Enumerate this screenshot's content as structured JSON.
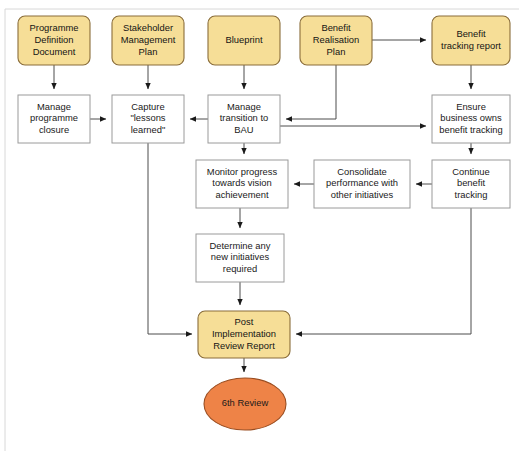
{
  "diagram": {
    "canvas": {
      "width": 520,
      "height": 451,
      "background": "#ffffff"
    },
    "colors": {
      "document_fill": "#f6de97",
      "document_stroke": "#8a6d3b",
      "process_fill": "#ffffff",
      "process_stroke": "#9a9a9a",
      "terminator_fill": "#ee8347",
      "terminator_stroke": "#9a4d20",
      "edge": "#4d4d4d",
      "text": "#1a1a1a",
      "frame": "#d8d8d8"
    },
    "nodes": [
      {
        "id": "programme-definition-document",
        "type": "document",
        "lines": [
          "Programme",
          "Definition",
          "Document"
        ],
        "x": 18,
        "y": 16,
        "w": 72,
        "h": 49,
        "rx": 7
      },
      {
        "id": "stakeholder-management-plan",
        "type": "document",
        "lines": [
          "Stakeholder",
          "Management",
          "Plan"
        ],
        "x": 112,
        "y": 16,
        "w": 72,
        "h": 49,
        "rx": 7
      },
      {
        "id": "blueprint",
        "type": "document",
        "lines": [
          "Blueprint"
        ],
        "x": 208,
        "y": 16,
        "w": 72,
        "h": 49,
        "rx": 7
      },
      {
        "id": "benefit-realisation-plan",
        "type": "document",
        "lines": [
          "Benefit",
          "Realisation",
          "Plan"
        ],
        "x": 300,
        "y": 16,
        "w": 72,
        "h": 49,
        "rx": 7
      },
      {
        "id": "benefit-tracking-report",
        "type": "document",
        "lines": [
          "Benefit",
          "tracking report"
        ],
        "x": 432,
        "y": 16,
        "w": 78,
        "h": 49,
        "rx": 7
      },
      {
        "id": "manage-programme-closure",
        "type": "process",
        "lines": [
          "Manage",
          "programme",
          "closure"
        ],
        "x": 18,
        "y": 95,
        "w": 72,
        "h": 48,
        "rx": 0
      },
      {
        "id": "capture-lessons-learned",
        "type": "process",
        "lines": [
          "Capture",
          "\"lessons",
          "learned\""
        ],
        "x": 112,
        "y": 95,
        "w": 72,
        "h": 48,
        "rx": 0
      },
      {
        "id": "manage-transition-to-bau",
        "type": "process",
        "lines": [
          "Manage",
          "transition to",
          "BAU"
        ],
        "x": 208,
        "y": 95,
        "w": 72,
        "h": 48,
        "rx": 0
      },
      {
        "id": "ensure-business-owns-benefit-tracking",
        "type": "process",
        "lines": [
          "Ensure",
          "business owns",
          "benefit tracking"
        ],
        "x": 432,
        "y": 95,
        "w": 78,
        "h": 48,
        "rx": 0
      },
      {
        "id": "monitor-progress-towards-vision-achievement",
        "type": "process",
        "lines": [
          "Monitor progress",
          "towards vision",
          "achievement"
        ],
        "x": 196,
        "y": 160,
        "w": 92,
        "h": 48,
        "rx": 0
      },
      {
        "id": "consolidate-performance-with-other-initiatives",
        "type": "process",
        "lines": [
          "Consolidate",
          "performance with",
          "other initiatives"
        ],
        "x": 314,
        "y": 160,
        "w": 96,
        "h": 48,
        "rx": 0
      },
      {
        "id": "continue-benefit-tracking",
        "type": "process",
        "lines": [
          "Continue",
          "benefit",
          "tracking"
        ],
        "x": 432,
        "y": 160,
        "w": 78,
        "h": 48,
        "rx": 0
      },
      {
        "id": "determine-any-new-initiatives-required",
        "type": "process",
        "lines": [
          "Determine any",
          "new initiatives",
          "required"
        ],
        "x": 196,
        "y": 234,
        "w": 88,
        "h": 48,
        "rx": 0
      },
      {
        "id": "post-implementation-review-report",
        "type": "document",
        "lines": [
          "Post",
          "Implementation",
          "Review Report"
        ],
        "x": 198,
        "y": 311,
        "w": 92,
        "h": 47,
        "rx": 7
      },
      {
        "id": "6th-review",
        "type": "terminator",
        "lines": [
          "6th Review"
        ],
        "cx": 245,
        "cy": 404,
        "rx": 41,
        "ry": 26
      }
    ],
    "edges": [
      {
        "id": "pdd-to-manage-closure",
        "from": "programme-definition-document",
        "to": "manage-programme-closure",
        "path": "M 54 65 L 54 89",
        "arrow": true
      },
      {
        "id": "smp-to-capture",
        "from": "stakeholder-management-plan",
        "to": "capture-lessons-learned",
        "path": "M 148 65 L 148 89",
        "arrow": true
      },
      {
        "id": "blueprint-to-manage-transition",
        "from": "blueprint",
        "to": "manage-transition-to-bau",
        "path": "M 244 65 L 244 89",
        "arrow": true
      },
      {
        "id": "brp-to-benefit-tracking-report",
        "from": "benefit-realisation-plan",
        "to": "benefit-tracking-report",
        "path": "M 372 40 L 426 40",
        "arrow": true
      },
      {
        "id": "brp-to-manage-transition",
        "from": "benefit-realisation-plan",
        "to": "manage-transition-to-bau",
        "path": "M 336 65 L 336 119 L 286 119",
        "arrow": true
      },
      {
        "id": "btr-to-ensure-business",
        "from": "benefit-tracking-report",
        "to": "ensure-business-owns-benefit-tracking",
        "path": "M 471 65 L 471 89",
        "arrow": true
      },
      {
        "id": "manage-closure-to-capture",
        "from": "manage-programme-closure",
        "to": "capture-lessons-learned",
        "path": "M 90 119 L 106 119",
        "arrow": true
      },
      {
        "id": "manage-transition-to-capture",
        "from": "manage-transition-to-bau",
        "to": "capture-lessons-learned",
        "path": "M 208 119 L 190 119",
        "arrow": true
      },
      {
        "id": "manage-transition-to-ensure-business",
        "from": "manage-transition-to-bau",
        "to": "ensure-business-owns-benefit-tracking",
        "path": "M 280 126 L 426 126",
        "arrow": true
      },
      {
        "id": "manage-transition-to-monitor",
        "from": "manage-transition-to-bau",
        "to": "monitor-progress-towards-vision-achievement",
        "path": "M 244 143 L 244 154",
        "arrow": true
      },
      {
        "id": "ensure-business-to-continue",
        "from": "ensure-business-owns-benefit-tracking",
        "to": "continue-benefit-tracking",
        "path": "M 471 143 L 471 154",
        "arrow": true
      },
      {
        "id": "continue-to-consolidate",
        "from": "continue-benefit-tracking",
        "to": "consolidate-performance-with-other-initiatives",
        "path": "M 432 184 L 416 184",
        "arrow": true
      },
      {
        "id": "consolidate-to-monitor",
        "from": "consolidate-performance-with-other-initiatives",
        "to": "monitor-progress-towards-vision-achievement",
        "path": "M 314 184 L 294 184",
        "arrow": true
      },
      {
        "id": "monitor-to-determine",
        "from": "monitor-progress-towards-vision-achievement",
        "to": "determine-any-new-initiatives-required",
        "path": "M 240 208 L 240 228",
        "arrow": true
      },
      {
        "id": "determine-to-pir",
        "from": "determine-any-new-initiatives-required",
        "to": "post-implementation-review-report",
        "path": "M 240 282 L 240 305",
        "arrow": true
      },
      {
        "id": "capture-to-pir",
        "from": "capture-lessons-learned",
        "to": "post-implementation-review-report",
        "path": "M 148 143 L 148 334 L 192 334",
        "arrow": true
      },
      {
        "id": "continue-to-pir",
        "from": "continue-benefit-tracking",
        "to": "post-implementation-review-report",
        "path": "M 471 208 L 471 334 L 296 334",
        "arrow": true
      },
      {
        "id": "pir-to-6th-review",
        "from": "post-implementation-review-report",
        "to": "6th-review",
        "path": "M 244 358 L 244 372",
        "arrow": true
      }
    ],
    "frame": {
      "top_rule_y": 9,
      "left_rule_x": 5
    }
  }
}
